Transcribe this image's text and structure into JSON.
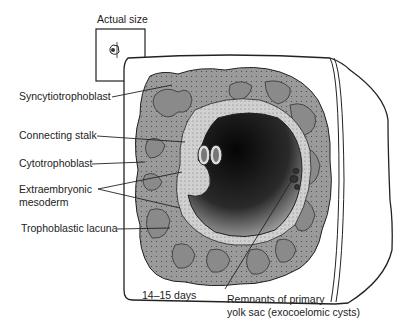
{
  "figure": {
    "inset": {
      "title": "Actual size"
    },
    "labels": {
      "syncytiotrophoblast": "Syncytiotrophoblast",
      "connecting_stalk": "Connecting stalk",
      "cytotrophoblast": "Cytotrophoblast",
      "extraembryonic_line1": "Extraembryonic",
      "extraembryonic_line2": "mesoderm",
      "trophoblastic_lacuna": "Trophoblastic lacuna",
      "remnants_line1": "Remnants of primary",
      "remnants_line2": "yolk sac (exocoelomic cysts)"
    },
    "stage": "14–15 days",
    "colors": {
      "tissue_dark": "#7a7a7a",
      "tissue_lacuna": "#8c8c8c",
      "mesoderm_light": "#c9c9c9",
      "cavity_dark": "#111111",
      "outline": "#222222"
    }
  }
}
